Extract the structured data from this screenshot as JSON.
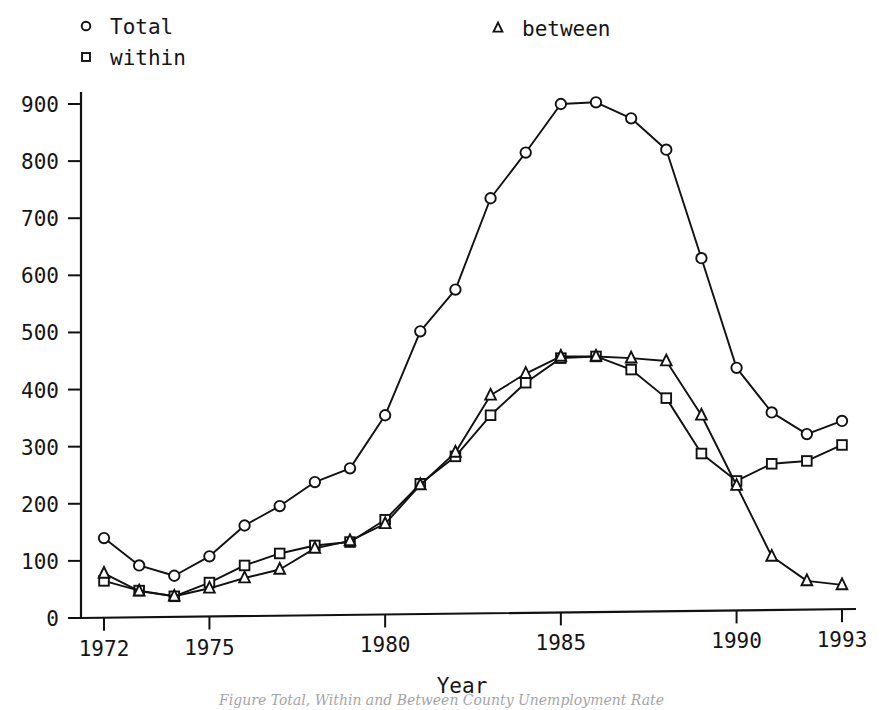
{
  "chart_data": {
    "type": "line",
    "title": "",
    "xlabel": "Year",
    "ylabel": "",
    "xlim": [
      1972,
      1993
    ],
    "ylim": [
      0,
      900
    ],
    "grid": false,
    "legend_position": "top",
    "x": [
      1972,
      1973,
      1974,
      1975,
      1976,
      1977,
      1978,
      1979,
      1980,
      1981,
      1982,
      1983,
      1984,
      1985,
      1986,
      1987,
      1988,
      1989,
      1990,
      1991,
      1992,
      1993
    ],
    "xticks": [
      "1972",
      "1975",
      "1980",
      "1985",
      "1990",
      "1993"
    ],
    "xtick_values": [
      1972,
      1975,
      1980,
      1985,
      1990,
      1993
    ],
    "yticks": [
      "0",
      "100",
      "200",
      "300",
      "400",
      "500",
      "600",
      "700",
      "800",
      "900"
    ],
    "ytick_values": [
      0,
      100,
      200,
      300,
      400,
      500,
      600,
      700,
      800,
      900
    ],
    "series": [
      {
        "name": "Total",
        "marker": "circle",
        "values": [
          140,
          92,
          74,
          108,
          162,
          196,
          238,
          262,
          355,
          502,
          575,
          735,
          815,
          900,
          903,
          875,
          820,
          630,
          438,
          360,
          322,
          345
        ]
      },
      {
        "name": "within",
        "marker": "square",
        "values": [
          65,
          48,
          38,
          62,
          92,
          113,
          127,
          133,
          172,
          235,
          283,
          355,
          412,
          455,
          458,
          435,
          385,
          288,
          240,
          270,
          275,
          303
        ]
      },
      {
        "name": "between",
        "marker": "triangle",
        "values": [
          78,
          47,
          38,
          52,
          70,
          85,
          122,
          135,
          165,
          233,
          290,
          390,
          428,
          458,
          458,
          455,
          450,
          355,
          232,
          108,
          65,
          58
        ]
      }
    ]
  },
  "legend": {
    "items": [
      {
        "label": "Total",
        "marker": "circle"
      },
      {
        "label": "within",
        "marker": "square"
      },
      {
        "label": "between",
        "marker": "triangle"
      }
    ]
  },
  "axis": {
    "x_title": "Year"
  },
  "caption": {
    "text": "Figure   Total, Within and Between County Unemployment Rate"
  }
}
